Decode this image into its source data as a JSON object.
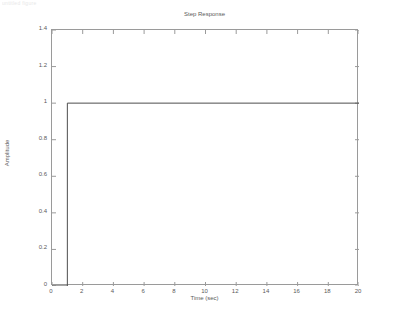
{
  "window": {
    "header_text": "untitled figure"
  },
  "chart_data": {
    "type": "line",
    "title": "Step Response",
    "xlabel": "Time (sec)",
    "ylabel": "Amplitude",
    "xlim": [
      0,
      20
    ],
    "ylim": [
      0,
      1.4
    ],
    "grid": false,
    "legend": null,
    "xticks": [
      0,
      2,
      4,
      6,
      8,
      10,
      12,
      14,
      16,
      18,
      20
    ],
    "xtick_labels": [
      "0",
      "2",
      "4",
      "6",
      "8",
      "10",
      "12",
      "14",
      "16",
      "18",
      "20"
    ],
    "yticks": [
      0,
      0.2,
      0.4,
      0.6,
      0.8,
      1,
      1.2,
      1.4
    ],
    "ytick_labels": [
      "0",
      "0.2",
      "0.4",
      "0.6",
      "0.8",
      "1",
      "1.2",
      "1.4"
    ],
    "line_color": "#4d4d4d",
    "series": [
      {
        "name": "Step Response",
        "x": [
          0,
          1,
          1,
          20
        ],
        "y": [
          0,
          0,
          1,
          1
        ]
      }
    ],
    "annotations": {
      "step_time": 1,
      "final_value": 1
    }
  }
}
